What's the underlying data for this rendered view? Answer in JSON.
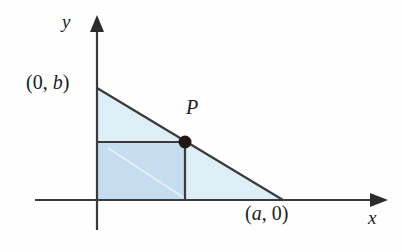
{
  "figure": {
    "background_color": "#fefefe",
    "width": 402,
    "height": 252
  },
  "axes": {
    "x_axis_label": "x",
    "y_axis_label": "y",
    "line_color": "#3a3a3a",
    "x_axis": {
      "y": 200,
      "x_start": 35,
      "x_end": 385
    },
    "y_axis": {
      "x": 97,
      "y_start": 18,
      "y_end": 230
    }
  },
  "labels": {
    "y_intercept": {
      "open": "(",
      "first": "0",
      "comma": ", ",
      "second": "b",
      "close": ")",
      "full": "(0, b)"
    },
    "x_intercept": {
      "open": "(",
      "first": "a",
      "comma": ", ",
      "second": "0",
      "close": ")",
      "full": "(a, 0)"
    },
    "point": "P"
  },
  "shapes": {
    "triangle": {
      "name": "triangle",
      "points": "97,88 283,200 97,200",
      "fill_color": "#ddeef7",
      "stroke_color": "#3a3a3a",
      "vertices": [
        [
          97,
          88
        ],
        [
          283,
          200
        ],
        [
          97,
          200
        ]
      ]
    },
    "rectangle": {
      "name": "inscribed-rectangle",
      "x": 97,
      "y": 142,
      "width": 88,
      "height": 58,
      "fill_color": "#c5ddee",
      "stroke_color": "#3a3a3a"
    },
    "point_P": {
      "name": "point-P",
      "cx": 185,
      "cy": 142,
      "r": 6.5,
      "fill_color": "#201a15"
    }
  },
  "chart_data": {
    "type": "line",
    "title": "",
    "xlabel": "x",
    "ylabel": "y",
    "annotations": [
      "(0, b)",
      "(a, 0)",
      "P"
    ],
    "series": [
      {
        "name": "line-through-P",
        "x": [
          0,
          "a"
        ],
        "y": [
          "b",
          0
        ]
      }
    ],
    "points": [
      {
        "label": "(0, b)",
        "x": 0,
        "y": "b"
      },
      {
        "label": "(a, 0)",
        "x": "a",
        "y": 0
      },
      {
        "label": "P",
        "x": "x",
        "y": "y"
      }
    ],
    "grid": false,
    "legend": "none"
  }
}
